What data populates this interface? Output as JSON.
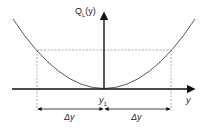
{
  "diagram": {
    "y_axis_label_prefix": "Q",
    "y_axis_label_sub": "L",
    "y_axis_label_suffix": "(y)",
    "x_axis_label": "y",
    "center_label": "y",
    "center_label_sub": "1",
    "left_interval_label": "Δy",
    "right_interval_label": "Δy",
    "colors": {
      "line": "#222222",
      "dashed": "#888888",
      "curve": "#444444"
    }
  }
}
